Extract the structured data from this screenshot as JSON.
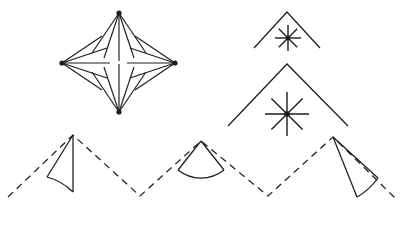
{
  "figure": {
    "canvas": {
      "width": 404,
      "height": 226
    },
    "background_color": "#ffffff",
    "stroke_color": "#1c1c22",
    "panels": [
      {
        "name": "diamond-fan-cluster",
        "description": "Four fan-shaped ray bundles whose apex hubs sit at the four vertices of a diamond; every bundle radiates inward toward the diamond centre.",
        "center": {
          "x": 119,
          "y": 63
        },
        "hub_dot_radius": 2.6,
        "fans": [
          {
            "name": "fan-top",
            "apex": {
              "x": 119,
              "y": 13
            },
            "direction": "down",
            "ray_count": 5,
            "ray_length": 48,
            "spread_degrees": 70,
            "rays": [
              {
                "x1": 119,
                "y1": 13,
                "x2": 92,
                "y2": 53
              },
              {
                "x1": 119,
                "y1": 13,
                "x2": 104,
                "y2": 58
              },
              {
                "x1": 119,
                "y1": 13,
                "x2": 119,
                "y2": 61
              },
              {
                "x1": 119,
                "y1": 13,
                "x2": 134,
                "y2": 58
              },
              {
                "x1": 119,
                "y1": 13,
                "x2": 146,
                "y2": 53
              }
            ]
          },
          {
            "name": "fan-left",
            "apex": {
              "x": 62,
              "y": 63
            },
            "direction": "right",
            "ray_count": 5,
            "ray_length": 48,
            "spread_degrees": 70,
            "rays": [
              {
                "x1": 62,
                "y1": 63,
                "x2": 102,
                "y2": 36
              },
              {
                "x1": 62,
                "y1": 63,
                "x2": 107,
                "y2": 48
              },
              {
                "x1": 62,
                "y1": 63,
                "x2": 110,
                "y2": 63
              },
              {
                "x1": 62,
                "y1": 63,
                "x2": 107,
                "y2": 78
              },
              {
                "x1": 62,
                "y1": 63,
                "x2": 102,
                "y2": 90
              }
            ]
          },
          {
            "name": "fan-right",
            "apex": {
              "x": 175,
              "y": 63
            },
            "direction": "left",
            "ray_count": 5,
            "ray_length": 48,
            "spread_degrees": 70,
            "rays": [
              {
                "x1": 175,
                "y1": 63,
                "x2": 135,
                "y2": 36
              },
              {
                "x1": 175,
                "y1": 63,
                "x2": 130,
                "y2": 48
              },
              {
                "x1": 175,
                "y1": 63,
                "x2": 127,
                "y2": 63
              },
              {
                "x1": 175,
                "y1": 63,
                "x2": 130,
                "y2": 78
              },
              {
                "x1": 175,
                "y1": 63,
                "x2": 135,
                "y2": 90
              }
            ]
          },
          {
            "name": "fan-bottom",
            "apex": {
              "x": 119,
              "y": 112
            },
            "direction": "up",
            "ray_count": 5,
            "ray_length": 48,
            "spread_degrees": 70,
            "rays": [
              {
                "x1": 119,
                "y1": 112,
                "x2": 92,
                "y2": 72
              },
              {
                "x1": 119,
                "y1": 112,
                "x2": 104,
                "y2": 67
              },
              {
                "x1": 119,
                "y1": 112,
                "x2": 119,
                "y2": 64
              },
              {
                "x1": 119,
                "y1": 112,
                "x2": 134,
                "y2": 67
              },
              {
                "x1": 119,
                "y1": 112,
                "x2": 146,
                "y2": 72
              }
            ]
          }
        ]
      },
      {
        "name": "chevron-star-stack",
        "description": "Two nested chevrons (carets) opening downward, each with an eight-ray asterisk starburst centred beneath its apex.",
        "items": [
          {
            "name": "chevron-small",
            "apex": {
              "x": 287,
              "y": 12
            },
            "left_end": {
              "x": 254,
              "y": 48
            },
            "right_end": {
              "x": 320,
              "y": 48
            },
            "star": {
              "name": "star-small",
              "center": {
                "x": 288,
                "y": 38
              },
              "ray_count": 8,
              "radius": 13,
              "hub_radius": 2.2
            }
          },
          {
            "name": "chevron-large",
            "apex": {
              "x": 287,
              "y": 64
            },
            "left_end": {
              "x": 228,
              "y": 126
            },
            "right_end": {
              "x": 348,
              "y": 126
            },
            "star": {
              "name": "star-large",
              "center": {
                "x": 287,
                "y": 114
              },
              "ray_count": 8,
              "radius": 22,
              "hub_radius": 2.8
            }
          }
        ]
      },
      {
        "name": "terrain-zigzag",
        "description": "A zigzag mountain profile of three peaks; the peak flanks alternate between dashed and solid strokes, and each peak carries a circular-sector (pie wedge) angle marker at its apex.",
        "vertices": [
          {
            "name": "left-base",
            "x": 8,
            "y": 197
          },
          {
            "name": "peak-1",
            "x": 73,
            "y": 135
          },
          {
            "name": "valley-1",
            "x": 140,
            "y": 196
          },
          {
            "name": "peak-2",
            "x": 201,
            "y": 141
          },
          {
            "name": "valley-2",
            "x": 268,
            "y": 196
          },
          {
            "name": "peak-3",
            "x": 333,
            "y": 137
          },
          {
            "name": "right-base",
            "x": 396,
            "y": 199
          }
        ],
        "segments": [
          {
            "name": "slope-1-up",
            "from": "left-base",
            "to": "peak-1",
            "style": "dashed"
          },
          {
            "name": "slope-1-down",
            "from": "peak-1",
            "to": "valley-1",
            "style": "dashed"
          },
          {
            "name": "slope-2-up",
            "from": "valley-1",
            "to": "peak-2",
            "style": "dashed"
          },
          {
            "name": "slope-2-down",
            "from": "peak-2",
            "to": "valley-2",
            "style": "dashed"
          },
          {
            "name": "slope-3-up",
            "from": "valley-2",
            "to": "peak-3",
            "style": "dashed"
          },
          {
            "name": "slope-3-down",
            "from": "peak-3",
            "to": "right-base",
            "style": "dashed"
          }
        ],
        "angle_wedges": [
          {
            "name": "wedge-peak-1",
            "apex": {
              "x": 73,
              "y": 135
            },
            "side_a_end": {
              "x": 73,
              "y": 192
            },
            "side_b_end": {
              "x": 47,
              "y": 177
            },
            "arc_radius": 58,
            "arc_sweep": 0,
            "opens": "left-down",
            "sides_solid": true
          },
          {
            "name": "wedge-peak-2",
            "apex": {
              "x": 201,
              "y": 141
            },
            "side_a_end": {
              "x": 178,
              "y": 170
            },
            "side_b_end": {
              "x": 224,
              "y": 170
            },
            "arc_radius": 37,
            "arc_sweep": 1,
            "opens": "down",
            "sides_solid": true
          },
          {
            "name": "wedge-peak-3",
            "apex": {
              "x": 333,
              "y": 137
            },
            "side_a_end": {
              "x": 357,
              "y": 197
            },
            "side_b_end": {
              "x": 378,
              "y": 178
            },
            "arc_radius": 65,
            "arc_sweep": 0,
            "opens": "right-down",
            "sides_solid": true
          }
        ]
      }
    ]
  }
}
